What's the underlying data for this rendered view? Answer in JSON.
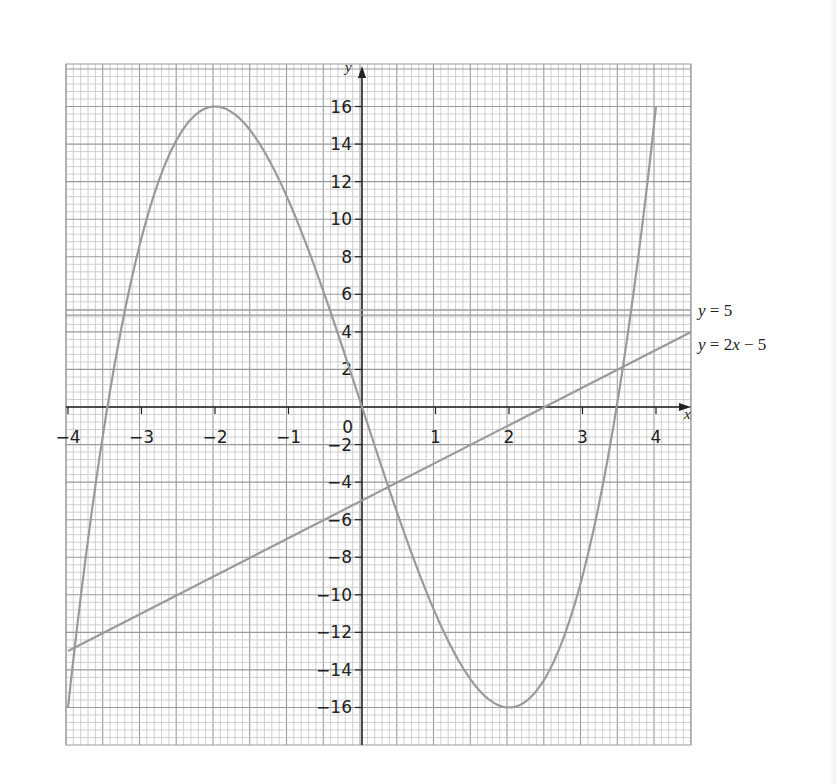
{
  "chart_data": {
    "type": "line",
    "title": "",
    "xlabel": "x",
    "ylabel": "y",
    "xlim": [
      -4,
      4.5
    ],
    "ylim": [
      -18,
      18
    ],
    "grid": true,
    "x_ticks": [
      -4,
      -3,
      -2,
      -1,
      1,
      2,
      3,
      4
    ],
    "x_tick_labels": [
      "−4",
      "−3",
      "−2",
      "−1",
      "1",
      "2",
      "3",
      "4"
    ],
    "y_ticks": [
      16,
      14,
      12,
      10,
      8,
      6,
      4,
      2,
      -2,
      -4,
      -6,
      -8,
      -10,
      -12,
      -14,
      -16
    ],
    "y_tick_labels": [
      "16",
      "14",
      "12",
      "10",
      "8",
      "6",
      "4",
      "2",
      "−2",
      "−4",
      "−6",
      "−8",
      "−10",
      "−12",
      "−14",
      "−16"
    ],
    "origin_label": "0",
    "series": [
      {
        "name": "y = x^3 - 12x",
        "kind": "cubic",
        "domain": [
          -4,
          4
        ],
        "x": [
          -4,
          -3.5,
          -3,
          -2.5,
          -2,
          -1.5,
          -1,
          -0.5,
          0,
          0.5,
          1,
          1.5,
          2,
          2.5,
          3,
          3.5,
          4
        ],
        "values": [
          -16,
          -0.875,
          9,
          14.375,
          16,
          14.625,
          11,
          5.875,
          0,
          -5.875,
          -11,
          -14.625,
          -16,
          -14.375,
          -9,
          0.875,
          16
        ]
      },
      {
        "name": "y = 5",
        "kind": "line",
        "domain": [
          -4,
          4.5
        ],
        "x": [
          -4,
          4.5
        ],
        "values": [
          5,
          5
        ],
        "label": "y = 5"
      },
      {
        "name": "y = 2x - 5",
        "kind": "line",
        "domain": [
          -4,
          4.5
        ],
        "x": [
          -4,
          4.5
        ],
        "values": [
          -13,
          4
        ],
        "label": "y = 2x − 5"
      }
    ],
    "annotations": [
      {
        "text": "y = 5",
        "x": 4.5,
        "y": 5
      },
      {
        "text": "y = 2x − 5",
        "x": 4.5,
        "y": 3
      }
    ]
  },
  "labels": {
    "x_axis": "x",
    "y_axis": "y",
    "line1_y": "y",
    "line1_rest": " = 5",
    "line2_y": "y",
    "line2_rest1": " = 2",
    "line2_x": "x",
    "line2_rest2": " − 5"
  },
  "colors": {
    "grid_minor": "#c4c4c4",
    "grid_major": "#9a9a9a",
    "axis": "#222222",
    "curve": "#9a9a9a",
    "text": "#222222"
  }
}
